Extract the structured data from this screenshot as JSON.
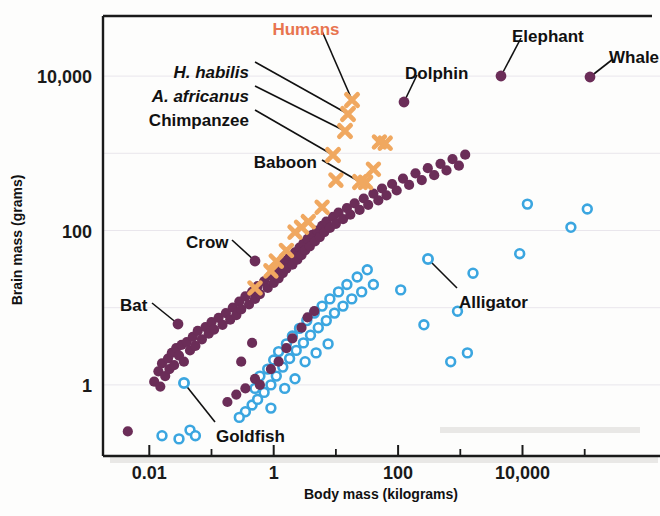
{
  "chart_data": {
    "type": "scatter",
    "title": "",
    "xlabel": "Body mass (kilograms)",
    "ylabel": "Brain mass (grams)",
    "xscale": "log",
    "yscale": "log",
    "xlim": [
      0.0018,
      1400000
    ],
    "ylim": [
      0.12,
      60000
    ],
    "grid": true,
    "legend_position": "none",
    "xticks": [
      {
        "value": 0.01,
        "label": "0.01",
        "major": true
      },
      {
        "value": 0.1,
        "label": "",
        "major": false
      },
      {
        "value": 1,
        "label": "1",
        "major": true
      },
      {
        "value": 10,
        "label": "",
        "major": false
      },
      {
        "value": 100,
        "label": "100",
        "major": true
      },
      {
        "value": 1000,
        "label": "",
        "major": false
      },
      {
        "value": 10000,
        "label": "10,000",
        "major": true
      },
      {
        "value": 100000,
        "label": "",
        "major": false
      }
    ],
    "yticks": [
      {
        "value": 10000,
        "label": "10,000",
        "major": true
      },
      {
        "value": 100,
        "label": "100",
        "major": true
      },
      {
        "value": 1,
        "label": "1",
        "major": true
      }
    ],
    "ygridlines": [
      10000,
      1000,
      100,
      10,
      1
    ],
    "series": [
      {
        "name": "mammals-and-birds",
        "marker": "filled-circle",
        "color": "#6B2D58",
        "points": [
          [
            0.0045,
            0.25
          ],
          [
            0.012,
            1.1
          ],
          [
            0.014,
            1.5
          ],
          [
            0.015,
            0.95
          ],
          [
            0.016,
            1.9
          ],
          [
            0.018,
            1.3
          ],
          [
            0.02,
            2.2
          ],
          [
            0.021,
            1.6
          ],
          [
            0.023,
            2.6
          ],
          [
            0.025,
            1.8
          ],
          [
            0.027,
            3.0
          ],
          [
            0.03,
            2.4
          ],
          [
            0.033,
            3.3
          ],
          [
            0.036,
            2.0
          ],
          [
            0.04,
            3.6
          ],
          [
            0.045,
            2.8
          ],
          [
            0.05,
            4.2
          ],
          [
            0.055,
            3.2
          ],
          [
            0.06,
            5.0
          ],
          [
            0.07,
            3.9
          ],
          [
            0.08,
            5.6
          ],
          [
            0.09,
            4.6
          ],
          [
            0.1,
            6.5
          ],
          [
            0.11,
            5.2
          ],
          [
            0.13,
            7.4
          ],
          [
            0.15,
            6.0
          ],
          [
            0.17,
            8.5
          ],
          [
            0.2,
            7.0
          ],
          [
            0.22,
            10.0
          ],
          [
            0.25,
            8.0
          ],
          [
            0.28,
            12.0
          ],
          [
            0.3,
            9.5
          ],
          [
            0.35,
            14.0
          ],
          [
            0.4,
            11.0
          ],
          [
            0.45,
            16.0
          ],
          [
            0.5,
            13.0
          ],
          [
            0.55,
            19.0
          ],
          [
            0.6,
            15.0
          ],
          [
            0.7,
            22.0
          ],
          [
            0.8,
            18.0
          ],
          [
            0.9,
            26.0
          ],
          [
            1.0,
            21.0
          ],
          [
            1.1,
            30.0
          ],
          [
            1.2,
            24.0
          ],
          [
            1.3,
            35.0
          ],
          [
            1.4,
            28.0
          ],
          [
            1.5,
            40.0
          ],
          [
            1.6,
            32.0
          ],
          [
            1.8,
            46.0
          ],
          [
            2.0,
            36.0
          ],
          [
            2.2,
            52.0
          ],
          [
            2.4,
            42.0
          ],
          [
            2.6,
            60.0
          ],
          [
            2.8,
            48.0
          ],
          [
            3.0,
            68.0
          ],
          [
            3.2,
            55.0
          ],
          [
            3.5,
            78.0
          ],
          [
            3.8,
            62.0
          ],
          [
            4.2,
            88.0
          ],
          [
            4.6,
            72.0
          ],
          [
            5.0,
            100.0
          ],
          [
            5.5,
            82.0
          ],
          [
            6.0,
            115.0
          ],
          [
            6.5,
            95.0
          ],
          [
            7.0,
            130.0
          ],
          [
            8.0,
            108.0
          ],
          [
            9.0,
            150.0
          ],
          [
            10.0,
            122.0
          ],
          [
            11.0,
            170.0
          ],
          [
            13.0,
            140.0
          ],
          [
            15.0,
            195.0
          ],
          [
            17.0,
            160.0
          ],
          [
            20.0,
            225.0
          ],
          [
            24.0,
            185.0
          ],
          [
            28.0,
            260.0
          ],
          [
            33.0,
            215.0
          ],
          [
            40.0,
            300.0
          ],
          [
            48.0,
            245.0
          ],
          [
            55.0,
            350.0
          ],
          [
            65.0,
            285.0
          ],
          [
            80.0,
            400.0
          ],
          [
            95.0,
            330.0
          ],
          [
            120.0,
            470.0
          ],
          [
            150.0,
            390.0
          ],
          [
            190.0,
            550.0
          ],
          [
            240.0,
            450.0
          ],
          [
            300.0,
            640.0
          ],
          [
            380.0,
            520.0
          ],
          [
            480.0,
            730.0
          ],
          [
            600.0,
            600.0
          ],
          [
            750.0,
            840.0
          ],
          [
            950.0,
            690.0
          ],
          [
            1200.0,
            960.0
          ],
          [
            0.9,
            1.6
          ],
          [
            1.2,
            2.0
          ],
          [
            1.6,
            3.0
          ],
          [
            2.0,
            4.0
          ],
          [
            2.8,
            5.5
          ],
          [
            3.5,
            7.5
          ],
          [
            4.5,
            9.0
          ],
          [
            0.5,
            1.2
          ],
          [
            0.6,
            1.0
          ],
          [
            0.35,
            0.9
          ],
          [
            0.25,
            0.75
          ],
          [
            0.18,
            0.6
          ],
          [
            0.3,
            2.0
          ],
          [
            0.45,
            3.5
          ]
        ]
      },
      {
        "name": "fish-and-reptiles",
        "marker": "open-circle",
        "color": "#3BA6E0",
        "points": [
          [
            0.016,
            0.22
          ],
          [
            0.03,
            0.2
          ],
          [
            0.045,
            0.26
          ],
          [
            0.055,
            0.22
          ],
          [
            0.45,
            0.55
          ],
          [
            0.5,
            0.9
          ],
          [
            0.55,
            0.65
          ],
          [
            0.6,
            1.3
          ],
          [
            0.7,
            0.8
          ],
          [
            0.8,
            1.6
          ],
          [
            0.9,
            1.0
          ],
          [
            1.0,
            2.1
          ],
          [
            1.1,
            1.3
          ],
          [
            1.2,
            2.7
          ],
          [
            1.4,
            1.7
          ],
          [
            1.6,
            3.4
          ],
          [
            1.8,
            2.2
          ],
          [
            2.0,
            4.3
          ],
          [
            2.3,
            2.8
          ],
          [
            2.6,
            5.4
          ],
          [
            3.0,
            3.5
          ],
          [
            3.4,
            6.8
          ],
          [
            3.9,
            4.4
          ],
          [
            4.5,
            8.5
          ],
          [
            5.2,
            5.5
          ],
          [
            6.0,
            10.5
          ],
          [
            7.0,
            6.8
          ],
          [
            8.0,
            13.0
          ],
          [
            9.5,
            8.5
          ],
          [
            11.0,
            16.0
          ],
          [
            13.0,
            10.5
          ],
          [
            15.0,
            20.0
          ],
          [
            18.0,
            13.0
          ],
          [
            22.0,
            25.0
          ],
          [
            26.0,
            16.0
          ],
          [
            32.0,
            31.0
          ],
          [
            40.0,
            20.0
          ],
          [
            0.35,
            0.45
          ],
          [
            0.28,
            0.38
          ],
          [
            0.9,
            0.5
          ],
          [
            1.5,
            0.9
          ],
          [
            2.2,
            1.2
          ],
          [
            3.2,
            2.0
          ],
          [
            4.8,
            2.6
          ],
          [
            7.5,
            3.4
          ],
          [
            110.0,
            17.0
          ],
          [
            260.0,
            6.0
          ],
          [
            900.0,
            9.0
          ],
          [
            1600.0,
            28.0
          ],
          [
            9000.0,
            50.0
          ],
          [
            12000.0,
            220.0
          ],
          [
            60000.0,
            110.0
          ],
          [
            110000.0,
            190.0
          ],
          [
            700.0,
            2.0
          ],
          [
            1300.0,
            2.6
          ]
        ]
      },
      {
        "name": "primates-and-hominins",
        "marker": "x-cross",
        "color": "#F0A860",
        "points": [
          [
            0.5,
            18.0
          ],
          [
            0.9,
            30.0
          ],
          [
            1.1,
            40.0
          ],
          [
            1.6,
            55.0
          ],
          [
            2.2,
            95.0
          ],
          [
            2.8,
            110.0
          ],
          [
            3.6,
            130.0
          ],
          [
            6.0,
            200.0
          ],
          [
            10.0,
            450.0
          ],
          [
            30.0,
            420.0
          ],
          [
            40.0,
            620.0
          ],
          [
            50.0,
            1400.0
          ],
          [
            62.0,
            1350.0
          ]
        ]
      }
    ],
    "annotations": [
      {
        "label": "Humans",
        "style": "bold-orange",
        "text_x": 306,
        "text_y": 23,
        "anchor": "middle",
        "leader": [
          [
            322,
            31
          ],
          [
            352,
            100
          ]
        ],
        "target_x": 352,
        "target_y": 100
      },
      {
        "label": "Dolphin",
        "style": "bold",
        "text_x": 405,
        "text_y": 67,
        "anchor": "start",
        "leader": [
          [
            417,
            75
          ],
          [
            404,
            102
          ]
        ],
        "target_x": 404,
        "target_y": 102
      },
      {
        "label": "Elephant",
        "style": "bold",
        "text_x": 512,
        "text_y": 30,
        "anchor": "start",
        "leader": [
          [
            521,
            38
          ],
          [
            501,
            76
          ]
        ],
        "target_x": 501,
        "target_y": 76
      },
      {
        "label": "Whale",
        "style": "bold",
        "text_x": 609,
        "text_y": 51,
        "anchor": "start",
        "leader": [
          [
            613,
            59
          ],
          [
            590,
            77
          ]
        ],
        "target_x": 590,
        "target_y": 77
      },
      {
        "label": "H. habilis",
        "style": "bold-italic",
        "text_x": 249,
        "text_y": 66,
        "anchor": "end",
        "leader": [
          [
            255,
            62
          ],
          [
            348,
            114
          ]
        ],
        "target_x": 348,
        "target_y": 114
      },
      {
        "label": "A. africanus",
        "style": "bold-italic",
        "text_x": 249,
        "text_y": 90,
        "anchor": "end",
        "leader": [
          [
            255,
            86
          ],
          [
            345,
            131
          ]
        ],
        "target_x": 345,
        "target_y": 131
      },
      {
        "label": "Chimpanzee",
        "style": "bold",
        "text_x": 249,
        "text_y": 114,
        "anchor": "end",
        "leader": [
          [
            255,
            110
          ],
          [
            333,
            155
          ]
        ],
        "target_x": 333,
        "target_y": 155
      },
      {
        "label": "Baboon",
        "style": "bold",
        "text_x": 317,
        "text_y": 156,
        "anchor": "end",
        "leader": [
          [
            322,
            160
          ],
          [
            360,
            182
          ]
        ],
        "target_x": 360,
        "target_y": 182
      },
      {
        "label": "Crow",
        "style": "bold",
        "text_x": 186,
        "text_y": 236,
        "anchor": "start",
        "leader": [
          [
            232,
            240
          ],
          [
            255,
            261
          ]
        ],
        "target_x": 255,
        "target_y": 261
      },
      {
        "label": "Bat",
        "style": "bold",
        "text_x": 120,
        "text_y": 299,
        "anchor": "start",
        "leader": [
          [
            152,
            303
          ],
          [
            178,
            324
          ]
        ],
        "target_x": 178,
        "target_y": 324
      },
      {
        "label": "Goldfish",
        "style": "bold",
        "text_x": 216,
        "text_y": 430,
        "anchor": "start",
        "leader": [
          [
            215,
            422
          ],
          [
            184,
            383
          ]
        ],
        "target_x": 184,
        "target_y": 383
      },
      {
        "label": "Alligator",
        "style": "bold",
        "text_x": 459,
        "text_y": 296,
        "anchor": "start",
        "leader": [
          [
            457,
            288
          ],
          [
            428,
            259
          ]
        ],
        "target_x": 428,
        "target_y": 259
      }
    ]
  },
  "axes": {
    "x_title": "Body mass (kilograms)",
    "y_title": "Brain mass (grams)"
  }
}
